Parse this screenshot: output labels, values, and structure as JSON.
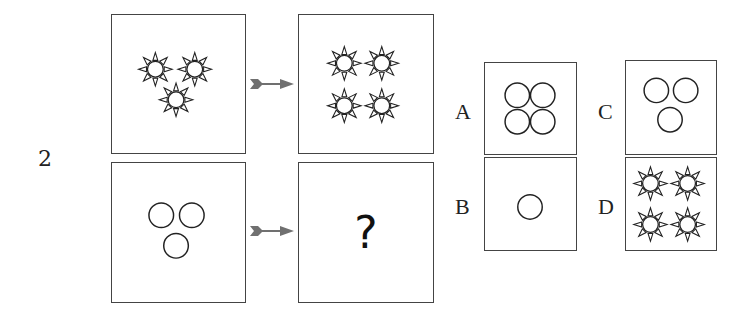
{
  "question": {
    "number": "2",
    "placeholder": "?"
  },
  "rows": [
    {
      "left": "three-suns-triangle",
      "right": "four-suns-grid"
    },
    {
      "left": "three-circles-triangle",
      "right": "unknown"
    }
  ],
  "options": [
    {
      "letter": "A",
      "content": "four-circles-grid"
    },
    {
      "letter": "B",
      "content": "one-circle"
    },
    {
      "letter": "C",
      "content": "three-circles-triangle"
    },
    {
      "letter": "D",
      "content": "four-suns-grid"
    }
  ],
  "colors": {
    "stroke": "#222222",
    "arrow": "#707070",
    "border": "#444444"
  }
}
